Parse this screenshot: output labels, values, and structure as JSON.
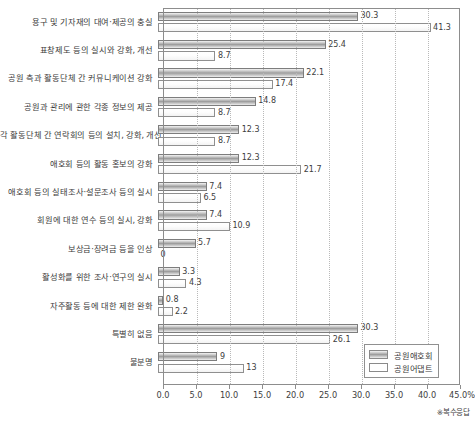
{
  "chart_data": {
    "type": "bar",
    "orientation": "horizontal",
    "title": "",
    "xlabel": "",
    "ylabel": "",
    "xlim": [
      0,
      45
    ],
    "xticks": [
      "0.0",
      "5.0",
      "10.0",
      "15.0",
      "20.0",
      "25.0",
      "30.0",
      "35.0",
      "40.0",
      "45.0%"
    ],
    "grid": true,
    "legend_position": "bottom-right",
    "annotation": "※복수응답",
    "categories": [
      "용구 및 기자재의 대여·제공의 충실",
      "표창제도 등의 실시와 강화, 개선",
      "공원 측과 활동단체 간 커뮤니케이션 강화",
      "공원과 관리에 관한 각종 정보의 제공",
      "각 활동단체 간 연락회의 등의 설치, 강화, 개선",
      "애호회 등의 활동 홍보의 강화",
      "애호회 등의 실태조사·설문조사 등의 실시",
      "회원에 대한 연수 등의 실시, 강화",
      "보상금·장려금 등을 인상",
      "활성화를 위한 조사·연구의 실시",
      "자주활동 등에 대한 제한 완화",
      "특별히 없음",
      "불분명"
    ],
    "series": [
      {
        "name": "공원애호회",
        "values": [
          30.3,
          25.4,
          22.1,
          14.8,
          12.3,
          12.3,
          7.4,
          7.4,
          5.7,
          3.3,
          0.8,
          30.3,
          9
        ],
        "labels": [
          "30.3",
          "25.4",
          "22.1",
          "14.8",
          "12.3",
          "12.3",
          "7.4",
          "7.4",
          "5.7",
          "3.3",
          "0.8",
          "30.3",
          "9"
        ]
      },
      {
        "name": "공원어댑트",
        "values": [
          41.3,
          8.7,
          17.4,
          8.7,
          8.7,
          21.7,
          6.5,
          10.9,
          0,
          4.3,
          2.2,
          26.1,
          13
        ],
        "labels": [
          "41.3",
          "8.7",
          "17.4",
          "8.7",
          "8.7",
          "21.7",
          "6.5",
          "10.9",
          "0",
          "4.3",
          "2.2",
          "26.1",
          "13"
        ]
      }
    ]
  },
  "legend": {
    "items": [
      {
        "label": "공원애호회"
      },
      {
        "label": "공원어댑트"
      }
    ]
  }
}
